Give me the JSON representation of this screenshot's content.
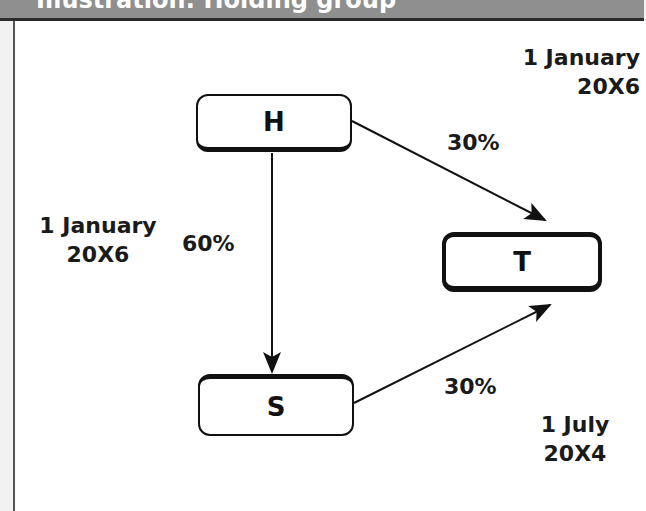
{
  "header": {
    "title": "Illustration: Holding group"
  },
  "nodes": {
    "h": {
      "label": "H"
    },
    "s": {
      "label": "S"
    },
    "t": {
      "label": "T"
    }
  },
  "edges": {
    "h_to_t": {
      "pct": "30%"
    },
    "h_to_s": {
      "pct": "60%"
    },
    "s_to_t": {
      "pct": "30%"
    }
  },
  "dates": {
    "h_to_t": {
      "line1": "1 January",
      "line2": "20X6"
    },
    "h_to_s": {
      "line1": "1 January",
      "line2": "20X6"
    },
    "s_to_t": {
      "line1": "1 July",
      "line2": "20X4"
    }
  }
}
